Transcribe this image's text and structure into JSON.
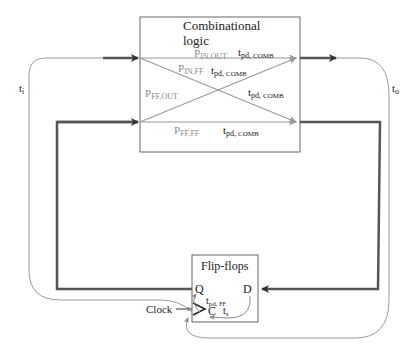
{
  "diagram": {
    "type": "sequential-circuit-timing-paths",
    "blocks": {
      "combinational": {
        "title_line1": "Combinational",
        "title_line2": "logic"
      },
      "flipflops": {
        "title": "Flip-flops",
        "port_q": "Q",
        "port_d": "D",
        "port_c": "C"
      }
    },
    "paths": [
      {
        "id": "in-out",
        "label_main": "P",
        "label_sub": "IN,OUT",
        "delay_main": "t",
        "delay_sub": "pd",
        "delay_suffix": "COMB"
      },
      {
        "id": "in-ff",
        "label_main": "P",
        "label_sub": "IN,FF",
        "delay_main": "t",
        "delay_sub": "pd",
        "delay_suffix": "COMB"
      },
      {
        "id": "ff-out",
        "label_main": "P",
        "label_sub": "FF,OUT",
        "delay_main": "t",
        "delay_sub": "pd",
        "delay_suffix": "COMB"
      },
      {
        "id": "ff-ff",
        "label_main": "P",
        "label_sub": "FF,FF",
        "delay_main": "t",
        "delay_sub": "pd",
        "delay_suffix": "COMB"
      }
    ],
    "timing_labels": {
      "t_input": {
        "main": "t",
        "sub": "i"
      },
      "t_output": {
        "main": "t",
        "sub": "o"
      },
      "t_pd_ff": {
        "main": "t",
        "sub": "pd",
        "suffix": "FF"
      },
      "t_setup": {
        "main": "t",
        "sub": "s"
      }
    },
    "clock_label": "Clock",
    "colors": {
      "thick_wire": "#555555",
      "thin_wire": "#9a9a9a",
      "path_label": "#8c8c8c",
      "text": "#222222",
      "box_border": "#666666"
    }
  }
}
